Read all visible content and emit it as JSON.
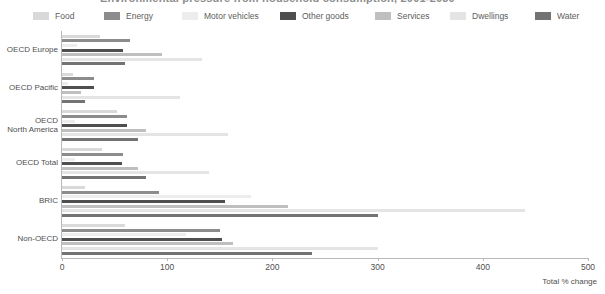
{
  "title": {
    "text": "Environmental pressure from household consumption, 2001-2030"
  },
  "legend": {
    "position": "top",
    "items": [
      {
        "label": "Food",
        "color": "#d9d9d9",
        "key": "food"
      },
      {
        "label": "Energy",
        "color": "#8c8c8c",
        "key": "energy"
      },
      {
        "label": "Motor vehicles",
        "color": "#ededed",
        "key": "motor_vehicles"
      },
      {
        "label": "Other goods",
        "color": "#4f4f4f",
        "key": "other_goods"
      },
      {
        "label": "Services",
        "color": "#bfbfbf",
        "key": "services"
      },
      {
        "label": "Dwellings",
        "color": "#e4e4e4",
        "key": "dwellings"
      },
      {
        "label": "Water",
        "color": "#737373",
        "key": "water"
      }
    ]
  },
  "axes": {
    "x": {
      "label": "Total % change",
      "min": 0,
      "max": 500,
      "ticks": [
        0,
        100,
        200,
        300,
        400,
        500
      ],
      "tick_labels": [
        "0",
        "100",
        "200",
        "300",
        "400",
        "500"
      ]
    },
    "y": {
      "categories": [
        "OECD Europe",
        "OECD Pacific",
        "OECD\nNorth America",
        "OECD Total",
        "BRIC",
        "Non-OECD"
      ]
    }
  },
  "chart_data": {
    "type": "bar",
    "orientation": "horizontal",
    "title": "Environmental pressure from household consumption, 2001-2030",
    "xlabel": "Total % change",
    "ylabel": "",
    "xlim": [
      0,
      500
    ],
    "grid": false,
    "legend_position": "top",
    "categories": [
      "OECD Europe",
      "OECD Pacific",
      "OECD North America",
      "OECD Total",
      "BRIC",
      "Non-OECD"
    ],
    "series": [
      {
        "name": "Food",
        "color": "#d9d9d9",
        "values": [
          36,
          10,
          52,
          38,
          22,
          60
        ]
      },
      {
        "name": "Energy",
        "color": "#8c8c8c",
        "values": [
          65,
          30,
          62,
          58,
          92,
          150
        ]
      },
      {
        "name": "Motor vehicles",
        "color": "#ededed",
        "values": [
          14,
          6,
          12,
          12,
          180,
          118
        ]
      },
      {
        "name": "Other goods",
        "color": "#4f4f4f",
        "values": [
          58,
          30,
          62,
          57,
          155,
          152
        ]
      },
      {
        "name": "Services",
        "color": "#bfbfbf",
        "values": [
          95,
          18,
          80,
          72,
          215,
          163
        ]
      },
      {
        "name": "Dwellings",
        "color": "#e4e4e4",
        "values": [
          133,
          112,
          158,
          140,
          440,
          300
        ]
      },
      {
        "name": "Water",
        "color": "#737373",
        "values": [
          60,
          22,
          72,
          80,
          300,
          238
        ]
      }
    ]
  }
}
